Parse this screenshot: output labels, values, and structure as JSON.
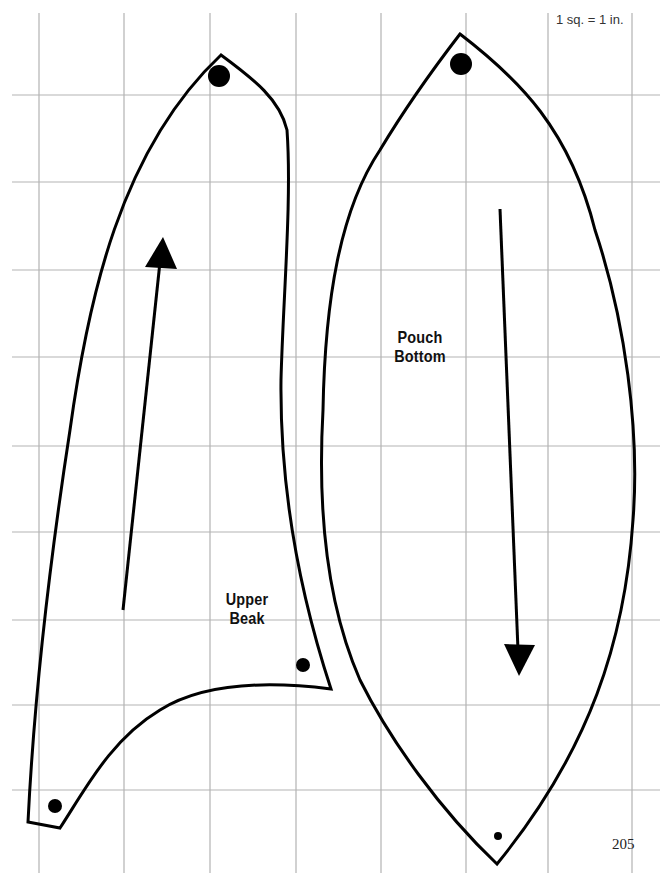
{
  "page": {
    "scale_note": "1 sq. = 1 in.",
    "page_number": "205"
  },
  "grid": {
    "color": "#b3b3b3",
    "x_lines": [
      39,
      124,
      210,
      296,
      381,
      466,
      548,
      632
    ],
    "y_lines": [
      95,
      182,
      270,
      357,
      446,
      532,
      620,
      705,
      790
    ],
    "x_start": 12,
    "x_end": 660,
    "y_start": 13,
    "y_end": 873
  },
  "pieces": [
    {
      "name": "Upper Beak",
      "label_lines": [
        "Upper",
        "Beak"
      ],
      "label_pos": {
        "x": 247,
        "y": 590
      },
      "arrow": {
        "direction": "up",
        "from": [
          123,
          610
        ],
        "to": [
          162,
          250
        ]
      },
      "dots": [
        {
          "x": 219,
          "y": 76,
          "r": 11
        },
        {
          "x": 303,
          "y": 665,
          "r": 7
        },
        {
          "x": 55,
          "y": 806,
          "r": 7
        }
      ]
    },
    {
      "name": "Pouch Bottom",
      "label_lines": [
        "Pouch",
        "Bottom"
      ],
      "label_pos": {
        "x": 420,
        "y": 328
      },
      "arrow": {
        "direction": "down",
        "from": [
          500,
          209
        ],
        "to": [
          519,
          660
        ]
      },
      "dots": [
        {
          "x": 461,
          "y": 64,
          "r": 11
        },
        {
          "x": 498,
          "y": 836,
          "r": 4
        }
      ]
    }
  ],
  "colors": {
    "outline": "#000000",
    "background": "#ffffff"
  }
}
